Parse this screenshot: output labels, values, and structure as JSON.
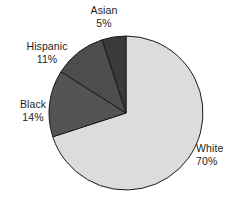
{
  "chart_data": {
    "type": "pie",
    "title": "",
    "subtitle": "",
    "xlabel": "",
    "ylabel": "",
    "legend_position": "none",
    "grid": false,
    "labels_outside": true,
    "start_angle_deg": 0,
    "direction": "clockwise",
    "categories": [
      "White",
      "Black",
      "Hispanic",
      "Asian"
    ],
    "values": [
      70,
      14,
      11,
      5
    ],
    "units": "%",
    "slices": [
      {
        "label": "White",
        "value": 70,
        "percent_text": "70%",
        "color": "#dcdcdc",
        "start_deg": 0,
        "end_deg": 252
      },
      {
        "label": "Black",
        "value": 14,
        "percent_text": "14%",
        "color": "#545454",
        "start_deg": 252,
        "end_deg": 302.4
      },
      {
        "label": "Hispanic",
        "value": 11,
        "percent_text": "11%",
        "color": "#4d4d4d",
        "start_deg": 302.4,
        "end_deg": 342
      },
      {
        "label": "Asian",
        "value": 5,
        "percent_text": "5%",
        "color": "#3a3a3a",
        "start_deg": 342,
        "end_deg": 360
      }
    ],
    "geometry": {
      "center_x": 126,
      "center_y": 113,
      "radius": 77
    },
    "style": {
      "background": "#ffffff",
      "slice_border": "#1a1a1a",
      "text_color": "#1d1d1d"
    }
  },
  "labels": {
    "asian": {
      "name": "Asian",
      "percent": "5%"
    },
    "hispanic": {
      "name": "Hispanic",
      "percent": "11%"
    },
    "black": {
      "name": "Black",
      "percent": "14%"
    },
    "white": {
      "name": "White",
      "percent": "70%"
    }
  }
}
